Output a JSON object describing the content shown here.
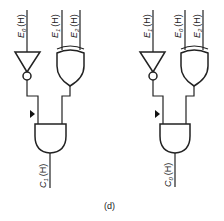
{
  "figure": {
    "caption": "(d)",
    "circuits": [
      {
        "id": "left",
        "inputs": [
          {
            "name": "E",
            "sub": "0",
            "level": "(H)",
            "role": "inverter-input"
          },
          {
            "name": "E",
            "sub": "1",
            "level": "(H)",
            "role": "xor-input-a"
          },
          {
            "name": "E",
            "sub": "2",
            "level": "(H)",
            "role": "xor-input-b"
          }
        ],
        "output": {
          "name": "C",
          "sub": "1",
          "level": "(H)"
        },
        "gates": [
          "NOT",
          "XOR",
          "AND"
        ]
      },
      {
        "id": "right",
        "inputs": [
          {
            "name": "E",
            "sub": "1",
            "level": "(H)",
            "role": "inverter-input"
          },
          {
            "name": "E",
            "sub": "0",
            "level": "(H)",
            "role": "xor-input-a"
          },
          {
            "name": "E",
            "sub": "2",
            "level": "(H)",
            "role": "xor-input-b"
          }
        ],
        "output": {
          "name": "C",
          "sub": "0",
          "level": "(H)"
        },
        "gates": [
          "NOT",
          "XOR",
          "AND"
        ]
      }
    ]
  }
}
